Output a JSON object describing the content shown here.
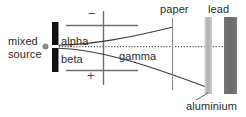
{
  "diagram": {
    "background_color": "#ffffff",
    "text_color": "#2a2a2a"
  },
  "source": {
    "label_line1": "mixed",
    "label_line2": "source",
    "dot_color": "#777777",
    "collimator_color": "#111111"
  },
  "electrodes": {
    "negative_sign": "−",
    "positive_sign": "+",
    "plate_color": "#6f6f6f"
  },
  "rays": [
    {
      "name": "alpha",
      "label": "alpha",
      "deflection": "up",
      "stopped_by": "paper",
      "color": "#3a3a3a",
      "style": "solid"
    },
    {
      "name": "beta",
      "label": "beta",
      "deflection": "down",
      "stopped_by": "aluminium",
      "color": "#3a3a3a",
      "style": "solid"
    },
    {
      "name": "gamma",
      "label": "gamma",
      "deflection": "none",
      "stopped_by": "lead",
      "color": "#555555",
      "style": "dotted"
    }
  ],
  "barriers": [
    {
      "name": "paper",
      "label": "paper",
      "color": "#8a8a8a",
      "thickness": "thin"
    },
    {
      "name": "aluminium",
      "label": "aluminium",
      "color": "#b6b6b6",
      "thickness": "medium"
    },
    {
      "name": "lead",
      "label": "lead",
      "color": "#6e6e6e",
      "thickness": "thick"
    }
  ]
}
